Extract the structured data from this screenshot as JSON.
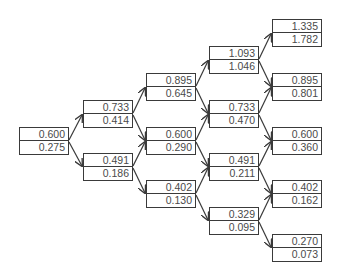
{
  "diagram": {
    "type": "binomial-tree",
    "steps": 4,
    "levels": [
      {
        "nodes": [
          {
            "value": "0.600",
            "sub": "0.275"
          }
        ]
      },
      {
        "nodes": [
          {
            "value": "0.733",
            "sub": "0.414"
          },
          {
            "value": "0.491",
            "sub": "0.186"
          }
        ]
      },
      {
        "nodes": [
          {
            "value": "0.895",
            "sub": "0.645"
          },
          {
            "value": "0.600",
            "sub": "0.290"
          },
          {
            "value": "0.402",
            "sub": "0.130"
          }
        ]
      },
      {
        "nodes": [
          {
            "value": "1.093",
            "sub": "1.046"
          },
          {
            "value": "0.733",
            "sub": "0.470"
          },
          {
            "value": "0.491",
            "sub": "0.211"
          },
          {
            "value": "0.329",
            "sub": "0.095"
          }
        ]
      },
      {
        "nodes": [
          {
            "value": "1.335",
            "sub": "1.782"
          },
          {
            "value": "0.895",
            "sub": "0.801"
          },
          {
            "value": "0.600",
            "sub": "0.360"
          },
          {
            "value": "0.402",
            "sub": "0.162"
          },
          {
            "value": "0.270",
            "sub": "0.073"
          }
        ]
      }
    ],
    "colors": {
      "line": "#3a3a3a",
      "text": "#4a4a4a",
      "background": "#ffffff"
    }
  }
}
